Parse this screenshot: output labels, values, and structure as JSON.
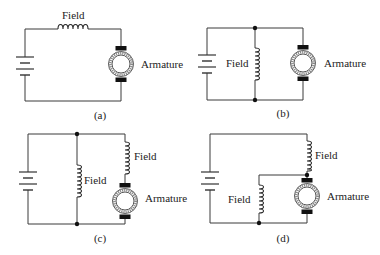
{
  "figure": {
    "panels": [
      {
        "id": "a",
        "caption": "(a)",
        "labels": {
          "field": "Field",
          "armature": "Armature"
        }
      },
      {
        "id": "b",
        "caption": "(b)",
        "labels": {
          "field": "Field",
          "armature": "Armature"
        }
      },
      {
        "id": "c",
        "caption": "(c)",
        "labels": {
          "field_shunt": "Field",
          "field_series": "Field",
          "armature": "Armature"
        }
      },
      {
        "id": "d",
        "caption": "(d)",
        "labels": {
          "field_series": "Field",
          "field_shunt": "Field",
          "armature": "Armature"
        }
      }
    ]
  },
  "colors": {
    "line": "#3a3a3a",
    "background": "#ffffff"
  }
}
